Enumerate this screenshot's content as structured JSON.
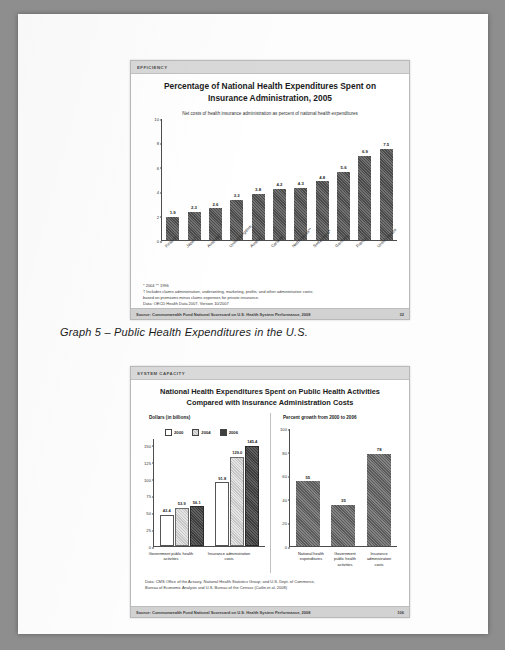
{
  "document": {
    "caption": "Graph 5 – Public Health Expenditures in the U.S."
  },
  "slide1": {
    "band": "EFFICIENCY",
    "title_line1": "Percentage of National Health Expenditures Spent on",
    "title_line2": "Insurance Administration, 2005",
    "subtitle": "Net costs of health insurance administration as percent of national health expenditures",
    "notes": "* 2004    ** 1996\n† Includes claims administration, underwriting, marketing, profits, and other administrative costs;\nbased on premiums minus claims expenses for private insurance.\nData: OECD Health Data 2007, Version 10/2007",
    "footer_source": "Source: Commonwealth Fund National Scorecard on U.S. Health System Performance, 2008",
    "page_number": "32",
    "chart_data": {
      "type": "bar",
      "title": "Percentage of National Health Expenditures Spent on Insurance Administration, 2005",
      "subtitle": "Net costs of health insurance administration as percent of national health expenditures",
      "xlabel": "",
      "ylabel": "",
      "ylim": [
        0,
        10
      ],
      "yticks": [
        0,
        2,
        4,
        6,
        8,
        10
      ],
      "grid": false,
      "legend": "none",
      "categories": [
        "Finland",
        "Japan*",
        "Australia*",
        "United Kingdom",
        "Austria",
        "Canada",
        "Netherlands**",
        "Switzerland*",
        "Germany",
        "France",
        "United States"
      ],
      "values": [
        1.9,
        2.3,
        2.6,
        3.3,
        3.8,
        4.2,
        4.3,
        4.8,
        5.6,
        6.9,
        7.5
      ]
    }
  },
  "slide2": {
    "band": "SYSTEM CAPACITY",
    "title_line1": "National Health Expenditures Spent on Public Health Activities",
    "title_line2": "Compared with Insurance Administration Costs",
    "notes": "Data: CMS Office of the Actuary, National Health Statistics Group; and U.S. Dept. of Commerce,\nBureau of Economic Analysis and U.S. Bureau of the Census (Catlin et al. 2008)",
    "footer_source": "Source: Commonwealth Fund National Scorecard on U.S. Health System Performance, 2008",
    "page_number": "106",
    "chart_data": [
      {
        "type": "bar",
        "title": "Dollars (in billions)",
        "panel": "left",
        "ylim": [
          0,
          160
        ],
        "yticks": [
          0,
          25,
          50,
          75,
          100,
          125,
          150
        ],
        "ylabel": "",
        "legend": [
          "2000",
          "2004",
          "2006"
        ],
        "legend_position": "top",
        "categories": [
          "Government public health activities",
          "Insurance administration costs"
        ],
        "series": [
          {
            "name": "2000",
            "values": [
              43.4,
              91.8
            ]
          },
          {
            "name": "2004",
            "values": [
              53.9,
              129.0
            ]
          },
          {
            "name": "2006",
            "values": [
              56.1,
              145.4
            ]
          }
        ]
      },
      {
        "type": "bar",
        "title": "Percent growth from 2000 to 2006",
        "panel": "right",
        "ylim": [
          0,
          100
        ],
        "yticks": [
          0,
          20,
          40,
          60,
          80,
          100
        ],
        "ylabel": "",
        "categories": [
          "National health expenditures",
          "Government public health activities",
          "Insurance administration costs"
        ],
        "values": [
          55,
          35,
          78
        ]
      }
    ]
  }
}
